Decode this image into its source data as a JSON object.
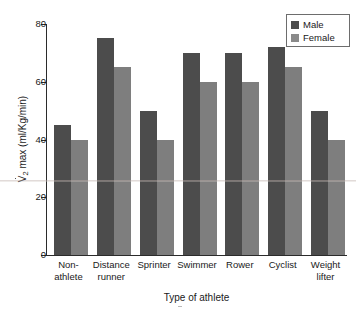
{
  "chart_data": {
    "type": "bar",
    "title": "",
    "xlabel": "Type of athlete",
    "ylabel": "VO2 max (ml/Kg/min)",
    "ylabel_parts": {
      "v_dot": "V",
      "sub": "2",
      "rest": " max (ml/Kg/min)"
    },
    "categories": [
      "Non-athlete",
      "Distance runner",
      "Sprinter",
      "Swimmer",
      "Rower",
      "Cyclist",
      "Weight lifter"
    ],
    "category_lines": [
      [
        "Non-",
        "athlete"
      ],
      [
        "Distance",
        "runner"
      ],
      [
        "Sprinter",
        ""
      ],
      [
        "Swimmer",
        ""
      ],
      [
        "Rower",
        ""
      ],
      [
        "Cyclist",
        ""
      ],
      [
        "Weight",
        "lifter"
      ]
    ],
    "series": [
      {
        "name": "Male",
        "color": "#4c4c4c",
        "values": [
          45,
          75,
          50,
          70,
          70,
          72,
          50
        ]
      },
      {
        "name": "Female",
        "color": "#7e7e7e",
        "values": [
          40,
          65,
          40,
          60,
          60,
          65,
          40
        ]
      }
    ],
    "ylim": [
      0,
      80
    ],
    "yticks": [
      0,
      20,
      40,
      60,
      80
    ],
    "ytick_labels": [
      "0",
      "20",
      "40",
      "60",
      "80"
    ],
    "grid": false,
    "legend_position": "top-right",
    "legend_entries": [
      "Male",
      "Female"
    ]
  },
  "legend": {
    "male_label": "Male",
    "female_label": "Female"
  },
  "axes": {
    "x_title": "Type of athlete",
    "y_title_prefix": "V",
    "y_title_sub": "2",
    "y_title_suffix": " max (ml/Kg/min)"
  }
}
